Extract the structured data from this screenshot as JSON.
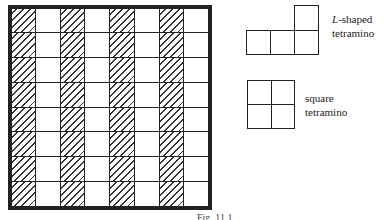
{
  "board": {
    "rows": 8,
    "columns": 8,
    "hatched_columns": [
      0,
      2,
      4,
      6
    ],
    "description": "8x8 board with alternating hatched columns"
  },
  "pieces": [
    {
      "name": "L-shaped tetramino",
      "label_italic": "L",
      "label_rest": "-shaped",
      "label_line2": "tetramino"
    },
    {
      "name": "square tetramino",
      "label_line1": "square",
      "label_line2": "tetramino"
    }
  ],
  "caption": "Fig. 11.1"
}
